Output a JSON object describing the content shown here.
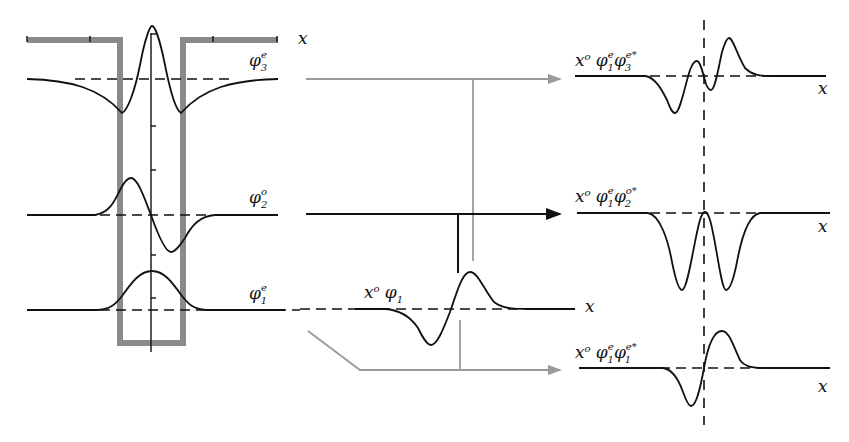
{
  "diagram": {
    "type": "quantum well wavefunction overlap / dipole matrix element schematic",
    "left_panel": {
      "well_shape": "finite square well (grey outline)",
      "axis_label": "x",
      "wavefunctions": [
        {
          "id": "phi3e",
          "symbol": "φ",
          "sub": "3",
          "sup": "e",
          "parity": "even"
        },
        {
          "id": "phi2o",
          "symbol": "φ",
          "sub": "2",
          "sup": "o",
          "parity": "odd"
        },
        {
          "id": "phi1e",
          "symbol": "φ",
          "sub": "1",
          "sup": "e",
          "parity": "even"
        }
      ]
    },
    "middle_panel": {
      "label_base": "x",
      "label_sup": "o",
      "label_phi": "φ",
      "label_sub": "1",
      "axis_label": "x"
    },
    "right_panel": {
      "products": [
        {
          "id": "prod13",
          "x_sup": "o",
          "a_sub": "1",
          "a_sup": "e",
          "b_sub": "3",
          "b_sup": "e*",
          "axis_label": "x",
          "result": "nonzero (asymmetric)"
        },
        {
          "id": "prod12",
          "x_sup": "o",
          "a_sub": "1",
          "a_sup": "e",
          "b_sub": "2",
          "b_sup": "o*",
          "axis_label": "x",
          "result": "nonzero (even, negative)"
        },
        {
          "id": "prod11",
          "x_sup": "o",
          "a_sub": "1",
          "a_sup": "e",
          "b_sub": "1",
          "b_sup": "e*",
          "axis_label": "x",
          "result": "zero (odd)"
        }
      ]
    },
    "arrows": [
      {
        "from": "phi3e",
        "to": "prod13",
        "color": "#9a9a9a"
      },
      {
        "from": "phi2o",
        "to": "prod12",
        "color": "#111111"
      },
      {
        "from": "phi1e",
        "to": "prod11",
        "color": "#9a9a9a"
      }
    ],
    "colors": {
      "well": "#8a8a8a",
      "grey_arrow": "#9a9a9a",
      "curve": "#111111",
      "background": "#ffffff"
    }
  }
}
